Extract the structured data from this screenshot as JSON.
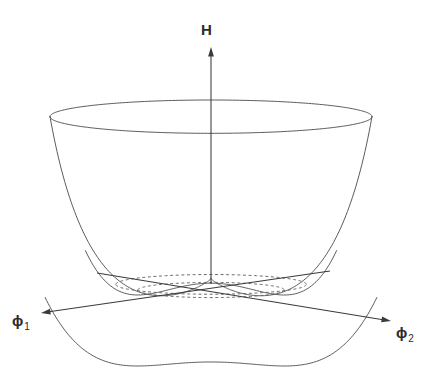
{
  "figure": {
    "title_visible": false,
    "kind": "mexican-hat-potential-surface",
    "background_color": "#ffffff",
    "line_color": "#4a4a4a",
    "dashed_color": "#6a6a6a",
    "axis_color": "#3a3a3a"
  },
  "axes": {
    "vertical": {
      "label": "H",
      "name": "hamiltonian-axis",
      "arrow": "up",
      "tip": [
        211,
        47
      ],
      "tail": [
        211,
        284
      ]
    },
    "left": {
      "label_base": "ϕ",
      "label_sub": "1",
      "name": "phi1-axis",
      "arrow": "left-down",
      "tip": [
        41,
        313
      ],
      "tail": [
        330,
        271
      ]
    },
    "right": {
      "label_base": "ϕ",
      "label_sub": "2",
      "name": "phi2-axis",
      "arrow": "right-down",
      "tip": [
        391,
        321
      ],
      "tail": [
        97,
        273
      ]
    }
  },
  "chart_data": {
    "type": "line",
    "xlabel": "ϕ₁",
    "ylabel": "ϕ₂",
    "zlabel": "H",
    "grid": false,
    "legend": null,
    "projection": {
      "center_x": 211,
      "center_y": 290,
      "radius_x": 161,
      "squash_y": 0.1035,
      "height_scale": 1.0
    },
    "potential": {
      "formula": "H = a*(r^2 - v^2)^2",
      "a": 1.0,
      "v_minimum_radius": 0.455,
      "peak_height_at_origin": 0.385,
      "rim_radius": 1.0,
      "rim_height": 1.0
    },
    "features": [
      {
        "name": "central-peak",
        "r": 0.0,
        "H": 0.385,
        "pixel": [
          211,
          230
        ]
      },
      {
        "name": "valley-circle",
        "r": 0.455,
        "H": 0.0,
        "pixel_back_y": 282,
        "pixel_front_y": 300
      },
      {
        "name": "rim-circle",
        "r": 1.0,
        "H": 1.0,
        "pixel_back_y": 100,
        "pixel_front_y": 133
      },
      {
        "name": "rim-left",
        "pixel": [
          50,
          118
        ]
      },
      {
        "name": "rim-right",
        "pixel": [
          372,
          118
        ]
      },
      {
        "name": "front-profile-bottom",
        "pixel": [
          211,
          366
        ]
      }
    ],
    "curves": [
      {
        "name": "rim-ellipse-back",
        "style": "solid"
      },
      {
        "name": "rim-ellipse-front",
        "style": "solid"
      },
      {
        "name": "silhouette-left",
        "style": "solid"
      },
      {
        "name": "silhouette-right",
        "style": "solid"
      },
      {
        "name": "front-profile",
        "style": "solid"
      },
      {
        "name": "peak-profile",
        "style": "solid"
      },
      {
        "name": "valley-ellipse-back",
        "style": "dashed"
      },
      {
        "name": "valley-ellipse-front",
        "style": "dashed"
      },
      {
        "name": "valley-inner-back",
        "style": "dashed"
      },
      {
        "name": "valley-inner-front",
        "style": "dashed"
      }
    ]
  }
}
